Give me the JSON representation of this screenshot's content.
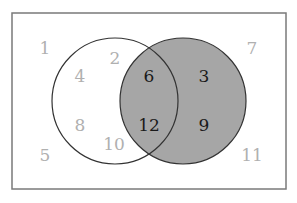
{
  "diagram": {
    "type": "venn",
    "colors": {
      "frame": "#7a7a7a",
      "shaded_set": "#a6a6a6",
      "circle_stroke": "#333333",
      "faded_number": "#b0b0b0",
      "dark_number": "#1a1a1a"
    },
    "universal_set": {
      "elements": [
        "1",
        "2",
        "3",
        "4",
        "5",
        "6",
        "7",
        "8",
        "9",
        "10",
        "11",
        "12"
      ]
    },
    "set_left": {
      "shaded": false,
      "only": [
        "2",
        "4",
        "8",
        "10"
      ]
    },
    "set_right": {
      "shaded": true,
      "only": [
        "3",
        "9"
      ]
    },
    "intersection": [
      "6",
      "12"
    ],
    "outside": [
      "1",
      "7",
      "5",
      "11"
    ]
  }
}
